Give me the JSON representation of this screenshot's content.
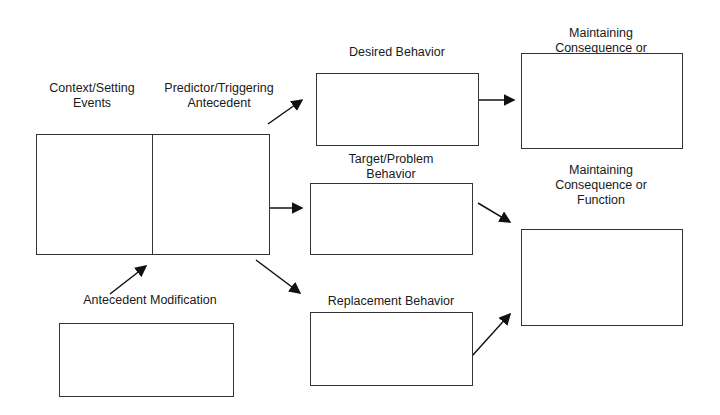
{
  "diagram": {
    "type": "behavior-pathway",
    "labels": {
      "context": [
        "Context/Setting",
        "Events"
      ],
      "predictor": [
        "Predictor/Triggering",
        "Antecedent"
      ],
      "desired": "Desired Behavior",
      "maint_top": [
        "Maintaining",
        "Consequence or"
      ],
      "target": [
        "Target/Problem",
        "Behavior"
      ],
      "maint_bottom": [
        "Maintaining",
        "Consequence or",
        "Function"
      ],
      "antecedent_mod": "Antecedent Modification",
      "replacement": "Replacement Behavior"
    },
    "colors": {
      "line": "#333333",
      "text": "#1a1a1a",
      "background": "#ffffff"
    }
  }
}
